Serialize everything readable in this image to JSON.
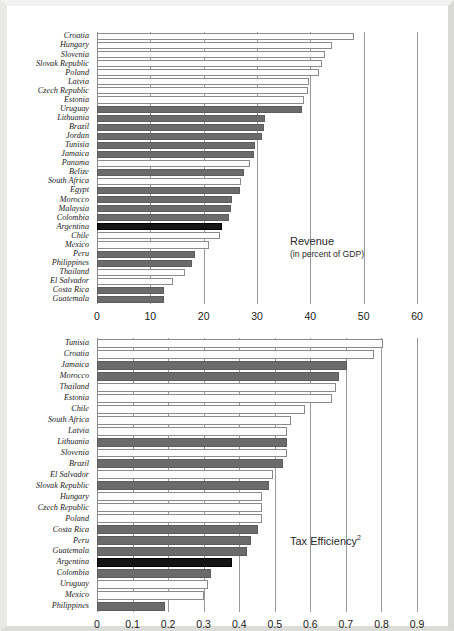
{
  "page": {
    "background_color": "#ffffff",
    "outer_color": "#c9c9c4"
  },
  "palette": {
    "bar_light": "#fdfdfd",
    "bar_gray": "#6b6b6b",
    "bar_black": "#141414",
    "gridline": "#9a9a9a",
    "text": "#1b1b1b"
  },
  "chart_data": [
    {
      "type": "bar",
      "orientation": "horizontal",
      "id": "revenue",
      "title": "Revenue",
      "subtitle": "(in percent of GDP)",
      "xlabel": "",
      "ylabel": "",
      "xlim": [
        0,
        60
      ],
      "xticks": [
        0,
        10,
        20,
        30,
        40,
        50,
        60
      ],
      "xtick_labels": [
        "0",
        "10",
        "20",
        "30",
        "40",
        "50",
        "60"
      ],
      "grid": true,
      "legend": "none",
      "annotation_position": "center-right",
      "categories": [
        "Croatia",
        "Hungary",
        "Slovenia",
        "Slovak Republic",
        "Poland",
        "Latvia",
        "Czech Republic",
        "Estonia",
        "Uruguay",
        "Lithuania",
        "Brazil",
        "Jordan",
        "Tunisia",
        "Jamaica",
        "Panama",
        "Belize",
        "South Africa",
        "Egypt",
        "Morocco",
        "Malaysia",
        "Colombia",
        "Argentina",
        "Chile",
        "Mexico",
        "Peru",
        "Philippines",
        "Thailand",
        "El Salvador",
        "Costa Rica",
        "Guatemala"
      ],
      "values": [
        48.2,
        44.0,
        42.8,
        42.1,
        41.6,
        39.7,
        39.6,
        38.8,
        38.5,
        31.5,
        31.3,
        31.0,
        29.6,
        29.4,
        28.6,
        27.6,
        27.0,
        26.9,
        25.4,
        25.2,
        24.7,
        23.4,
        23.0,
        21.0,
        18.4,
        17.8,
        16.5,
        14.2,
        12.6,
        12.6
      ],
      "bar_styles": [
        "light",
        "light",
        "light",
        "light",
        "light",
        "light",
        "light",
        "light",
        "gray",
        "gray",
        "gray",
        "gray",
        "gray",
        "gray",
        "light",
        "gray",
        "light",
        "gray",
        "gray",
        "gray",
        "gray",
        "black",
        "light",
        "light",
        "gray",
        "gray",
        "light",
        "light",
        "gray",
        "gray"
      ]
    },
    {
      "type": "bar",
      "orientation": "horizontal",
      "id": "tax_efficiency",
      "title": "Tax Efficiency",
      "title_superscript": "2",
      "subtitle": "",
      "xlabel": "",
      "ylabel": "",
      "xlim": [
        0,
        0.9
      ],
      "xticks": [
        0,
        0.1,
        0.2,
        0.3,
        0.4,
        0.5,
        0.6,
        0.7,
        0.8,
        0.9
      ],
      "xtick_labels": [
        "0",
        "0.1",
        "0.2",
        "0.3",
        "0.4",
        "0.5",
        "0.6",
        "0.7",
        "0.8",
        "0.9"
      ],
      "grid": true,
      "legend": "none",
      "annotation_position": "center-right",
      "categories": [
        "Tunisia",
        "Croatia",
        "Jamaica",
        "Morocco",
        "Thailand",
        "Estonia",
        "Chile",
        "South Africa",
        "Latvia",
        "Lithuania",
        "Slovenia",
        "Brazil",
        "El Salvador",
        "Slovak Republic",
        "Hungary",
        "Czech Republic",
        "Poland",
        "Costa Rica",
        "Peru",
        "Guatemala",
        "Argentina",
        "Colombia",
        "Uruguay",
        "Mexico",
        "Philippines"
      ],
      "values": [
        0.805,
        0.78,
        0.702,
        0.682,
        0.672,
        0.662,
        0.585,
        0.545,
        0.535,
        0.533,
        0.533,
        0.522,
        0.494,
        0.484,
        0.465,
        0.464,
        0.463,
        0.452,
        0.434,
        0.422,
        0.38,
        0.322,
        0.312,
        0.302,
        0.192
      ],
      "bar_styles": [
        "light",
        "light",
        "gray",
        "gray",
        "light",
        "light",
        "light",
        "light",
        "light",
        "gray",
        "light",
        "gray",
        "light",
        "gray",
        "light",
        "light",
        "light",
        "gray",
        "gray",
        "gray",
        "black",
        "gray",
        "light",
        "light",
        "gray"
      ]
    }
  ]
}
